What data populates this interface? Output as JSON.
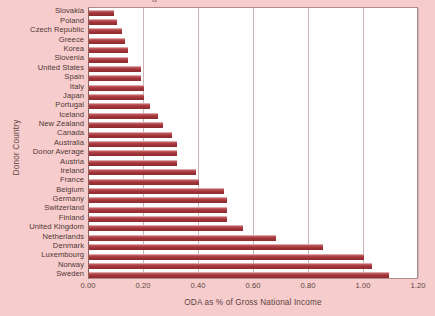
{
  "figure": {
    "background_color": "#f6cdcc",
    "plot_background_color": "#fffefe",
    "bar_color": "#a83c42",
    "gridline_color": "#c9b3b3",
    "axis_text_color": "#5d4243",
    "clipped_title_fragment": "g"
  },
  "chart_data": {
    "type": "bar",
    "orientation": "horizontal",
    "title": "",
    "xlabel": "ODA as % of Gross National Income",
    "ylabel": "Donor Country",
    "xlim": [
      0.0,
      1.2
    ],
    "xticks": [
      "0.00",
      "0.20",
      "0.40",
      "0.60",
      "0.80",
      "1.00",
      "1.20"
    ],
    "xtick_values": [
      0.0,
      0.2,
      0.4,
      0.6,
      0.8,
      1.0,
      1.2
    ],
    "grid": "vertical",
    "legend": "none",
    "categories": [
      "Slovakia",
      "Poland",
      "Czech Republic",
      "Greece",
      "Korea",
      "Slovenia",
      "United States",
      "Spain",
      "Italy",
      "Japan",
      "Portugal",
      "Iceland",
      "New Zealand",
      "Canada",
      "Australia",
      "Donor Average",
      "Austria",
      "Ireland",
      "France",
      "Belgium",
      "Germany",
      "Switzerland",
      "Finland",
      "United Kingdom",
      "Netherlands",
      "Denmark",
      "Luxembourg",
      "Norway",
      "Sweden"
    ],
    "values": [
      0.09,
      0.1,
      0.12,
      0.13,
      0.14,
      0.14,
      0.19,
      0.19,
      0.2,
      0.2,
      0.22,
      0.25,
      0.27,
      0.3,
      0.32,
      0.32,
      0.32,
      0.39,
      0.4,
      0.49,
      0.5,
      0.5,
      0.5,
      0.56,
      0.68,
      0.85,
      1.0,
      1.03,
      1.09
    ]
  }
}
